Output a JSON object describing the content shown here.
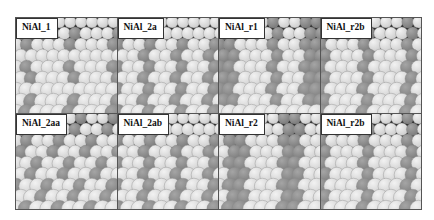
{
  "figure": {
    "panels": [
      {
        "label": "NiAl_1",
        "pattern": "sparse"
      },
      {
        "label": "NiAl_2a",
        "pattern": "pairs"
      },
      {
        "label": "NiAl_r1",
        "pattern": "rows"
      },
      {
        "label": "NiAl_r2b",
        "pattern": "rows-wide"
      },
      {
        "label": "NiAl_2aa",
        "pattern": "dense"
      },
      {
        "label": "NiAl_2ab",
        "pattern": "pairs"
      },
      {
        "label": "NiAl_r2",
        "pattern": "rows-double"
      },
      {
        "label": "NiAl_r2b",
        "pattern": "rows-wide"
      }
    ]
  },
  "colors": {
    "light_atom": "#cfcfcf",
    "dark_atom": "#7d7d7d",
    "background": "#2a2a2a"
  }
}
